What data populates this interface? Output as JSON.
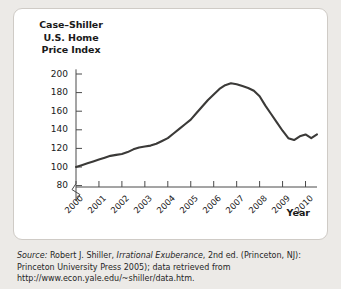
{
  "figure": {
    "title_lines": [
      "Case–Shiller",
      "U.S. Home",
      "Price Index"
    ],
    "axis_name_x": "Year",
    "source_prefix": "Source:",
    "source_part1": " Robert J. Shiller, ",
    "source_italic": "Irrational Exuberance",
    "source_part2": ", 2nd ed. (Princeton, NJ): Princeton University Press 2005); data retrieved from http://www.econ.yale.edu/~shiller/data.htm.",
    "colors": {
      "page_background": "#eceae7",
      "panel_background": "#ffffff",
      "panel_border": "#cfcbc6",
      "line": "#3b3a38",
      "axis": "#4a4a4a",
      "text": "#1a1a1a"
    }
  },
  "chart_data": {
    "type": "line",
    "title": "Case–Shiller U.S. Home Price Index",
    "xlabel": "Year",
    "ylabel": "Case–Shiller U.S. Home Price Index",
    "grid": false,
    "legend": "none",
    "axis_break_below": 80,
    "ylim": [
      80,
      205
    ],
    "yticks": [
      80,
      100,
      120,
      140,
      160,
      180,
      200
    ],
    "ytick_labels": [
      "80",
      "100",
      "120",
      "140",
      "160",
      "180",
      "200"
    ],
    "xlim": [
      2000,
      2010.5
    ],
    "xticks": [
      2000,
      2001,
      2002,
      2003,
      2004,
      2005,
      2006,
      2007,
      2008,
      2009,
      2010
    ],
    "xtick_labels": [
      "2000",
      "2001",
      "2002",
      "2003",
      "2004",
      "2005",
      "2006",
      "2007",
      "2008",
      "2009",
      "2010"
    ],
    "series": [
      {
        "name": "Case-Shiller U.S. Home Price Index",
        "x": [
          2000.0,
          2000.25,
          2000.5,
          2000.75,
          2001.0,
          2001.25,
          2001.5,
          2001.75,
          2002.0,
          2002.25,
          2002.5,
          2002.75,
          2003.0,
          2003.25,
          2003.5,
          2003.75,
          2004.0,
          2004.25,
          2004.5,
          2004.75,
          2005.0,
          2005.25,
          2005.5,
          2005.75,
          2006.0,
          2006.25,
          2006.5,
          2006.75,
          2007.0,
          2007.25,
          2007.5,
          2007.75,
          2008.0,
          2008.25,
          2008.5,
          2008.75,
          2009.0,
          2009.25,
          2009.5,
          2009.75,
          2010.0,
          2010.25,
          2010.5
        ],
        "values": [
          100,
          102,
          104,
          106,
          108,
          110,
          112,
          113,
          114,
          116,
          119,
          121,
          122,
          123,
          125,
          128,
          131,
          136,
          141,
          146,
          151,
          158,
          165,
          172,
          178,
          184,
          188,
          190,
          189,
          187,
          185,
          182,
          176,
          166,
          157,
          148,
          139,
          131,
          129,
          133,
          135,
          131,
          135
        ]
      }
    ],
    "annotations": [
      {
        "label": "peak",
        "x": 2006.75,
        "y": 190
      },
      {
        "label": "start",
        "x": 2000.0,
        "y": 100
      },
      {
        "label": "trough",
        "x": 2009.5,
        "y": 129
      }
    ]
  }
}
